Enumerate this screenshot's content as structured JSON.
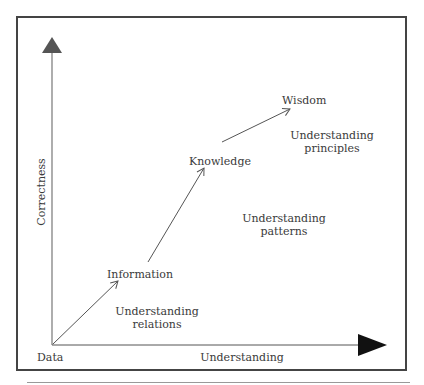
{
  "diagram": {
    "type": "DIKW hierarchy",
    "axes": {
      "y_label": "Correctness",
      "x_label": "Understanding",
      "origin_label": "Data"
    },
    "stages": [
      {
        "name": "Data"
      },
      {
        "name": "Information",
        "transition": [
          "Understanding",
          "relations"
        ]
      },
      {
        "name": "Knowledge",
        "transition": [
          "Understanding",
          "patterns"
        ]
      },
      {
        "name": "Wisdom",
        "transition": [
          "Understanding",
          "principles"
        ]
      }
    ],
    "colors": {
      "frame": "#444444",
      "y_arrowhead": "#555555",
      "x_arrowhead": "#111111",
      "lines": "#555555",
      "text": "#3a3a3a"
    }
  }
}
